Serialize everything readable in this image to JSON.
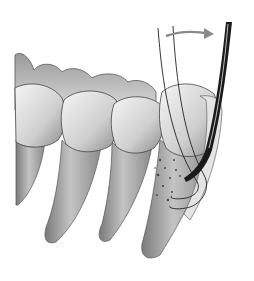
{
  "illustration": {
    "subject": "dental-scaling-of-lower-molars",
    "elements": [
      "teeth-row",
      "root-with-calculus",
      "curette-instrument",
      "rotation-arrow"
    ],
    "colors": {
      "background": "#ffffff",
      "enamel_light": "#f2f2f2",
      "enamel_mid": "#c8c8c8",
      "root": "#a8a8a8",
      "root_dark": "#6e6e6e",
      "instrument": "#1a1a1a",
      "arrow": "#9a9a9a",
      "calculus": "#555555"
    }
  }
}
